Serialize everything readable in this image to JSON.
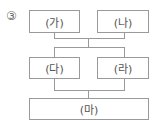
{
  "question_number": "③",
  "diagram": {
    "row1": [
      {
        "label": "(가)"
      },
      {
        "label": "(나)"
      }
    ],
    "row2": [
      {
        "label": "(다)"
      },
      {
        "label": "(라)"
      }
    ],
    "row3": [
      {
        "label": "(마)"
      }
    ]
  }
}
